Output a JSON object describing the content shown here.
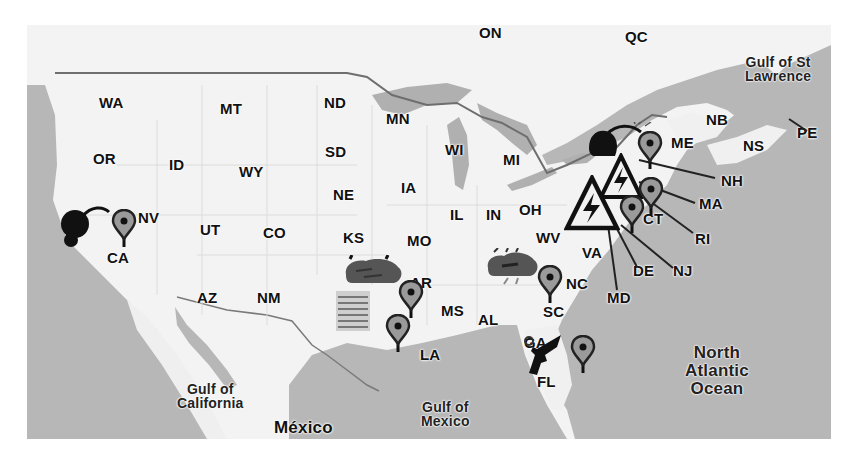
{
  "map": {
    "style": "grayscale",
    "colors": {
      "land": "#f3f3f3",
      "water": "#b5b5b5",
      "border": "#6a6a6a",
      "marker": "#9a9a9a",
      "icon": "#111111"
    },
    "states": [
      {
        "code": "WA",
        "x": 72,
        "y": 70
      },
      {
        "code": "MT",
        "x": 193,
        "y": 76
      },
      {
        "code": "ND",
        "x": 297,
        "y": 70
      },
      {
        "code": "MN",
        "x": 359,
        "y": 86
      },
      {
        "code": "OR",
        "x": 66,
        "y": 126
      },
      {
        "code": "ID",
        "x": 142,
        "y": 132
      },
      {
        "code": "WY",
        "x": 212,
        "y": 139
      },
      {
        "code": "SD",
        "x": 298,
        "y": 119
      },
      {
        "code": "WI",
        "x": 418,
        "y": 117
      },
      {
        "code": "MI",
        "x": 476,
        "y": 127
      },
      {
        "code": "NE",
        "x": 306,
        "y": 162
      },
      {
        "code": "IA",
        "x": 374,
        "y": 155
      },
      {
        "code": "NV",
        "x": 111,
        "y": 185
      },
      {
        "code": "UT",
        "x": 173,
        "y": 197
      },
      {
        "code": "CO",
        "x": 236,
        "y": 200
      },
      {
        "code": "IL",
        "x": 423,
        "y": 182
      },
      {
        "code": "IN",
        "x": 459,
        "y": 182
      },
      {
        "code": "OH",
        "x": 492,
        "y": 177
      },
      {
        "code": "KS",
        "x": 316,
        "y": 205
      },
      {
        "code": "MO",
        "x": 380,
        "y": 208
      },
      {
        "code": "WV",
        "x": 509,
        "y": 205
      },
      {
        "code": "VA",
        "x": 555,
        "y": 220
      },
      {
        "code": "CA",
        "x": 80,
        "y": 225
      },
      {
        "code": "AR",
        "x": 383,
        "y": 250
      },
      {
        "code": "NC",
        "x": 539,
        "y": 251
      },
      {
        "code": "AZ",
        "x": 170,
        "y": 265
      },
      {
        "code": "NM",
        "x": 230,
        "y": 265
      },
      {
        "code": "MS",
        "x": 414,
        "y": 278
      },
      {
        "code": "AL",
        "x": 451,
        "y": 287
      },
      {
        "code": "SC",
        "x": 516,
        "y": 279
      },
      {
        "code": "GA",
        "x": 497,
        "y": 310
      },
      {
        "code": "LA",
        "x": 393,
        "y": 322
      },
      {
        "code": "FL",
        "x": 510,
        "y": 349
      },
      {
        "code": "ME",
        "x": 644,
        "y": 110
      },
      {
        "code": "NB",
        "x": 679,
        "y": 87
      },
      {
        "code": "NS",
        "x": 716,
        "y": 113
      },
      {
        "code": "PE",
        "x": 770,
        "y": 100
      },
      {
        "code": "NH",
        "x": 694,
        "y": 148
      },
      {
        "code": "MA",
        "x": 672,
        "y": 171
      },
      {
        "code": "CT",
        "x": 616,
        "y": 186
      },
      {
        "code": "RI",
        "x": 668,
        "y": 206
      },
      {
        "code": "DE",
        "x": 606,
        "y": 238
      },
      {
        "code": "NJ",
        "x": 646,
        "y": 238
      },
      {
        "code": "MD",
        "x": 580,
        "y": 265
      },
      {
        "code": "ON",
        "x": 452,
        "y": 0
      },
      {
        "code": "QC",
        "x": 598,
        "y": 4
      }
    ],
    "water_labels": [
      {
        "name": "gulf-of-st-lawrence",
        "lines": [
          "Gulf of St",
          "Lawrence"
        ],
        "x": 718,
        "y": 30
      },
      {
        "name": "gulf-of-california",
        "lines": [
          "Gulf of",
          "California"
        ],
        "x": 150,
        "y": 357
      },
      {
        "name": "gulf-of-mexico",
        "lines": [
          "Gulf of",
          "Mexico"
        ],
        "x": 394,
        "y": 375
      },
      {
        "name": "north-atlantic-ocean",
        "lines": [
          "North",
          "Atlantic",
          "Ocean"
        ],
        "x": 658,
        "y": 319
      }
    ],
    "country_label": {
      "text": "México",
      "x": 247,
      "y": 395
    },
    "markers": [
      {
        "name": "map-pin-ca",
        "state": "CA",
        "x": 84,
        "y": 184
      },
      {
        "name": "map-pin-ar",
        "state": "AR",
        "x": 371,
        "y": 255
      },
      {
        "name": "map-pin-ar-south",
        "state": "LA",
        "x": 358,
        "y": 289
      },
      {
        "name": "map-pin-ga",
        "state": "GA",
        "x": 510,
        "y": 240
      },
      {
        "name": "map-pin-fl",
        "state": "FL",
        "x": 543,
        "y": 310
      },
      {
        "name": "map-pin-me",
        "state": "ME",
        "x": 610,
        "y": 106
      },
      {
        "name": "map-pin-ct",
        "state": "CT",
        "x": 611,
        "y": 152
      },
      {
        "name": "map-pin-nj",
        "state": "NJ",
        "x": 592,
        "y": 170
      }
    ],
    "event_icons": [
      {
        "name": "bomb-icon",
        "type": "bomb",
        "x": 36,
        "y": 177
      },
      {
        "name": "bomb-icon-ne",
        "type": "bomb",
        "x": 564,
        "y": 97
      },
      {
        "name": "high-voltage-warning-icon",
        "type": "warning",
        "x": 540,
        "y": 151
      },
      {
        "name": "high-voltage-warning-icon-2",
        "type": "warning",
        "x": 575,
        "y": 130
      },
      {
        "name": "storm-cloud-icon-ar",
        "type": "storm",
        "x": 318,
        "y": 231
      },
      {
        "name": "storm-cloud-icon-ga",
        "type": "storm",
        "x": 458,
        "y": 224
      },
      {
        "name": "flood-icon",
        "type": "flood",
        "x": 308,
        "y": 268
      },
      {
        "name": "gun-icon",
        "type": "gun",
        "x": 497,
        "y": 318
      }
    ]
  }
}
